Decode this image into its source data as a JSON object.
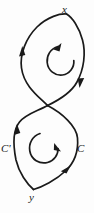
{
  "figure": {
    "stroke_color": "#1a1a1a",
    "background_color": "#fdfdfd",
    "labels": {
      "top_vertex": "x",
      "bottom_vertex": "y",
      "left_branch": "C'",
      "right_branch": "C"
    },
    "icons": {
      "top_loop_rotation": "counterclockwise-arrow-icon",
      "bottom_loop_rotation": "counterclockwise-arrow-icon"
    },
    "arrowheads": [
      {
        "name": "top-loop-left-arrowhead",
        "direction": "up"
      },
      {
        "name": "top-loop-right-arrowhead",
        "direction": "down"
      },
      {
        "name": "bottom-loop-left-arrowhead",
        "direction": "up"
      },
      {
        "name": "bottom-loop-right-arrowhead",
        "direction": "up-right"
      }
    ]
  }
}
